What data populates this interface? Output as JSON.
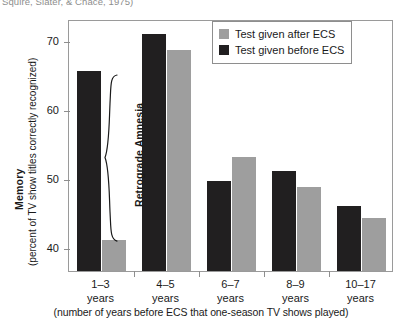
{
  "citation": "Squire, Slater, & Chace, 1975)",
  "axes": {
    "y_title_main": "Memory",
    "y_title_sub": "(percent of TV show titles correctly recognized)",
    "x_title": "(number of years before ECS that one-season TV shows played)"
  },
  "legend": {
    "position": "top-right",
    "items": [
      {
        "label": "Test given after ECS",
        "color": "#9e9e9e",
        "key": "after"
      },
      {
        "label": "Test given before ECS",
        "color": "#211f20",
        "key": "before"
      }
    ]
  },
  "annotation": {
    "label": "Retrograde Amnesia",
    "group": "1-3 years"
  },
  "category_labels": [
    {
      "line1": "1–3",
      "line2": "years"
    },
    {
      "line1": "4–5",
      "line2": "years"
    },
    {
      "line1": "6–7",
      "line2": "years"
    },
    {
      "line1": "8–9",
      "line2": "years"
    },
    {
      "line1": "10–17",
      "line2": "years"
    }
  ],
  "chart_data": {
    "type": "bar",
    "title": "",
    "subtitle": "",
    "xlabel": "(number of years before ECS that one-season TV shows played)",
    "ylabel": "Memory (percent of TV show titles correctly recognized)",
    "categories": [
      "1–3 years",
      "4–5 years",
      "6–7 years",
      "8–9 years",
      "10–17 years"
    ],
    "series": [
      {
        "name": "Test given before ECS",
        "color": "#211f20",
        "values": [
          65.5,
          70.8,
          49.5,
          51.0,
          45.9
        ]
      },
      {
        "name": "Test given after ECS",
        "color": "#9e9e9e",
        "values": [
          41.0,
          68.5,
          53.0,
          48.6,
          44.2
        ]
      }
    ],
    "ylim": [
      36.5,
      73.0
    ],
    "yticks": [
      40,
      50,
      60,
      70
    ],
    "ytick_labels": [
      "40",
      "50",
      "60",
      "70"
    ],
    "grid": false,
    "legend_position": "top-right",
    "annotations": [
      {
        "text": "Retrograde Amnesia",
        "type": "brace",
        "target_category": "1–3 years"
      }
    ]
  }
}
